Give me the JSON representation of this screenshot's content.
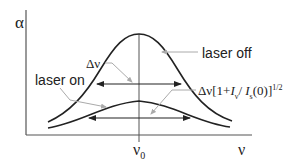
{
  "diagram": {
    "type": "spectral line saturation broadening",
    "axes": {
      "y_label": "α",
      "x_label": "ν",
      "center_tick_label": "ν",
      "center_tick_sub": "0"
    },
    "curves": [
      {
        "name": "laser off",
        "description": "tall narrow absorption profile"
      },
      {
        "name": "laser on",
        "description": "short broadened absorption profile"
      }
    ],
    "labels": {
      "laser_off": "laser off",
      "laser_on": "laser on",
      "delta_nu": "Δν",
      "broadened_width_prefix": "Δν[1+",
      "broadened_width_I": "I",
      "broadened_width_I_sub": "ν",
      "broadened_width_slash": "/ ",
      "broadened_width_Is": "I",
      "broadened_width_Is_sub": "s",
      "broadened_width_suffix": "(0)]",
      "broadened_width_exp": "1/2"
    },
    "colors": {
      "curve": "#222222",
      "axis": "#333333",
      "leader": "#999999"
    }
  }
}
